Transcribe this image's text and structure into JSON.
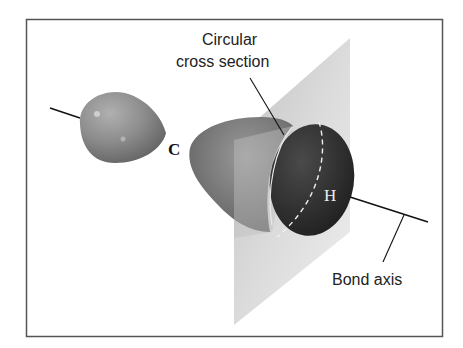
{
  "figure": {
    "labels": {
      "cross_section_line1": "Circular",
      "cross_section_line2": "cross section",
      "bond_axis": "Bond axis",
      "atom_carbon": "C",
      "atom_hydrogen": "H"
    },
    "colors": {
      "frame": "#555555",
      "small_lobe": "#8a8a8a",
      "large_lobe": "#6f6f6f",
      "cross_section_face": "#2b2b2b",
      "plane": "#c8c8c8",
      "lines": "#111111"
    }
  }
}
